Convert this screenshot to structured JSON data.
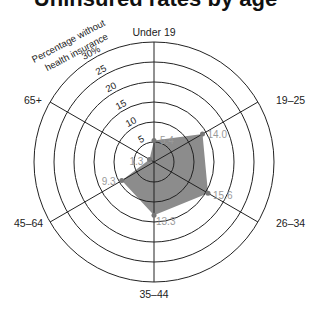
{
  "title": "Uninsured rates by age",
  "chart_data": {
    "type": "radar",
    "title": "Uninsured rates by age",
    "radial_axis_label": "Percentage without health insurance",
    "rings": [
      5,
      10,
      15,
      20,
      25,
      30
    ],
    "ring_labels": [
      "5",
      "10",
      "15",
      "20",
      "25",
      "30%"
    ],
    "categories": [
      "Under 19",
      "19–25",
      "26–34",
      "35–44",
      "45–64",
      "65+"
    ],
    "values": [
      5.4,
      14.0,
      15.6,
      13.3,
      9.3,
      1.3
    ],
    "value_labels": [
      "5.4",
      "14.0",
      "15.6",
      "13.3",
      "9.3",
      "1.3"
    ],
    "rmax": 30,
    "fill_color": "#8c8c8c",
    "value_label_color": "#9a9a9a"
  },
  "radial_label_line1": "Percentage without",
  "radial_label_line2": "health insurance"
}
